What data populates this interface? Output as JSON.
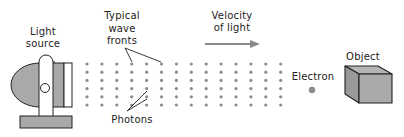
{
  "diagram": {
    "labels": {
      "light_source": [
        "Light",
        "source"
      ],
      "wave_fronts": [
        "Typical",
        "wave",
        "fronts"
      ],
      "velocity": [
        "Velocity",
        "of light"
      ],
      "photons": "Photons",
      "electron": "Electron",
      "object": "Object"
    },
    "colors": {
      "fill_gray": "#a9a9a9",
      "dot": "#8c8c8c",
      "line": "#222222",
      "arrow": "#8a8a8a"
    },
    "photon_grid": {
      "columns": 14,
      "rows": 6,
      "x_start": 87,
      "x_step": 14.9,
      "y_start": 64,
      "y_step": 8.2
    }
  }
}
